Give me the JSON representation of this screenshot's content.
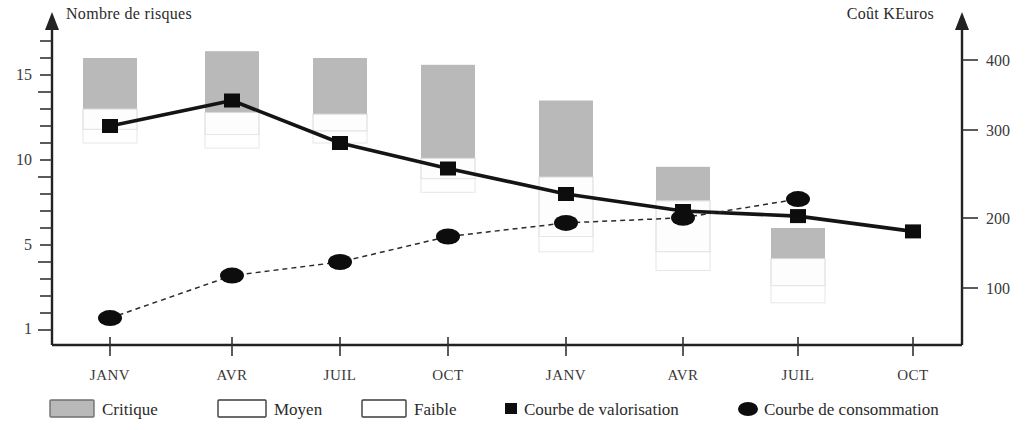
{
  "chart_data": {
    "type": "bar",
    "title": "",
    "subtitle": "",
    "xlabel": "",
    "ylabel": "Nombre de risques",
    "y2label": "Coût  KEuros",
    "categories": [
      "JANV",
      "AVR",
      "JUIL",
      "OCT",
      "JANV",
      "AVR",
      "JUIL",
      "OCT"
    ],
    "ylim": [
      1,
      17
    ],
    "y_ticks": [
      1,
      5,
      10,
      15
    ],
    "y_tick_labels": [
      "1",
      "5",
      "10",
      "15"
    ],
    "y2lim": [
      0,
      450
    ],
    "y2_ticks": [
      100,
      200,
      300,
      400
    ],
    "y2_tick_labels": [
      "100",
      "200",
      "300",
      "400"
    ],
    "grid": false,
    "legend_position": "bottom",
    "series": [
      {
        "name": "Critique",
        "kind": "bar-stack-segment",
        "color": "#b9b9b9",
        "axis": "left",
        "values": [
          3.0,
          3.6,
          3.3,
          5.5,
          4.5,
          2.0,
          1.8,
          0
        ]
      },
      {
        "name": "Moyen",
        "kind": "bar-stack-segment",
        "color": "#fdfdfd",
        "axis": "left",
        "values": [
          1.2,
          1.3,
          1.0,
          1.2,
          3.5,
          3.0,
          1.6,
          0
        ]
      },
      {
        "name": "Faible",
        "kind": "bar-stack-segment",
        "color": "#ffffff",
        "axis": "left",
        "values": [
          0.8,
          0.8,
          0.7,
          0.8,
          0.9,
          1.1,
          1.0,
          0
        ]
      },
      {
        "name": "Courbe de valorisation",
        "kind": "line",
        "marker": "square",
        "dash": false,
        "color": "#0d0d0d",
        "axis": "left",
        "x": [
          "JANV",
          "AVR",
          "JUIL",
          "OCT",
          "JANV",
          "AVR",
          "JUIL",
          "OCT"
        ],
        "values": [
          13.0,
          14.5,
          12.0,
          10.5,
          9.0,
          8.0,
          7.7,
          6.8
        ]
      },
      {
        "name": "Courbe de consommation",
        "kind": "line",
        "marker": "circle",
        "dash": true,
        "color": "#0d0d0d",
        "axis": "right",
        "x": [
          "JANV",
          "AVR",
          "JUIL",
          "OCT",
          "JANV",
          "AVR",
          "JUIL"
        ],
        "values_left_scale": [
          1.7,
          4.2,
          5.0,
          6.5,
          7.3,
          7.6,
          8.7
        ],
        "values": [
          95,
          165,
          188,
          228,
          250,
          258,
          290
        ]
      }
    ]
  },
  "axes": {
    "left_title": "Nombre de risques",
    "right_title": "Coût  KEuros",
    "left_ticks": [
      {
        "label": "15",
        "value": 15
      },
      {
        "label": "10",
        "value": 10
      },
      {
        "label": "5",
        "value": 5
      },
      {
        "label": "1",
        "value": 1
      }
    ],
    "right_ticks": [
      {
        "label": "400",
        "value": 400
      },
      {
        "label": "300",
        "value": 300
      },
      {
        "label": "200",
        "value": 200
      },
      {
        "label": "100",
        "value": 100
      }
    ],
    "categories": [
      "JANV",
      "AVR",
      "JUIL",
      "OCT",
      "JANV",
      "AVR",
      "JUIL",
      "OCT"
    ]
  },
  "legend": {
    "items": [
      {
        "label": "Critique",
        "swatch": "filled-gray-rect"
      },
      {
        "label": "Moyen",
        "swatch": "open-rect"
      },
      {
        "label": "Faible",
        "swatch": "open-rect"
      },
      {
        "label": "Courbe de valorisation",
        "swatch": "black-square-marker"
      },
      {
        "label": "Courbe de consommation",
        "swatch": "black-circle-marker"
      }
    ]
  },
  "colors": {
    "critique": "#b9b9b9",
    "moyen": "#fdfdfd",
    "faible": "#ffffff",
    "line": "#0d0d0d",
    "axis": "#222222",
    "text": "#2b2b2b"
  }
}
